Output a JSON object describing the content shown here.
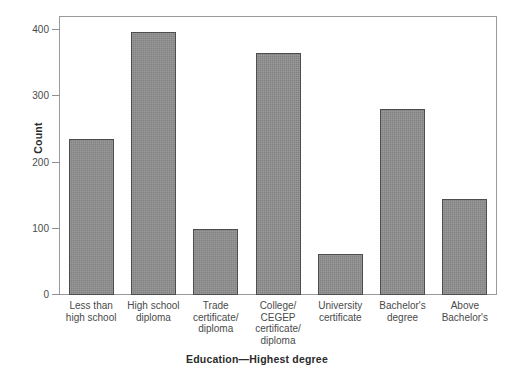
{
  "chart_data": {
    "type": "bar",
    "title": "",
    "xlabel": "Education—Highest degree",
    "ylabel": "Count",
    "categories": [
      "Less than high school",
      "High school diploma",
      "Trade certificate/ diploma",
      "College/ CEGEP certificate/ diploma",
      "University certificate",
      "Bachelor's degree",
      "Above Bachelor's"
    ],
    "category_lines": [
      [
        "Less than",
        "high school"
      ],
      [
        "High school",
        "diploma"
      ],
      [
        "Trade",
        "certificate/",
        "diploma"
      ],
      [
        "College/",
        "CEGEP",
        "certificate/",
        "diploma"
      ],
      [
        "University",
        "certificate"
      ],
      [
        "Bachelor's",
        "degree"
      ],
      [
        "Above",
        "Bachelor's"
      ]
    ],
    "values": [
      235,
      397,
      100,
      366,
      62,
      281,
      145
    ],
    "ylim": [
      0,
      420
    ],
    "yticks": [
      0,
      100,
      200,
      300,
      400
    ],
    "ytick_labels": [
      "0",
      "100",
      "200",
      "300",
      "400"
    ],
    "grid": false,
    "legend": "none",
    "bar_color": "#8e8e8e",
    "bar_edge_color": "#4d4d4d",
    "frame_color": "#9a9a9a",
    "background": "#ffffff"
  }
}
